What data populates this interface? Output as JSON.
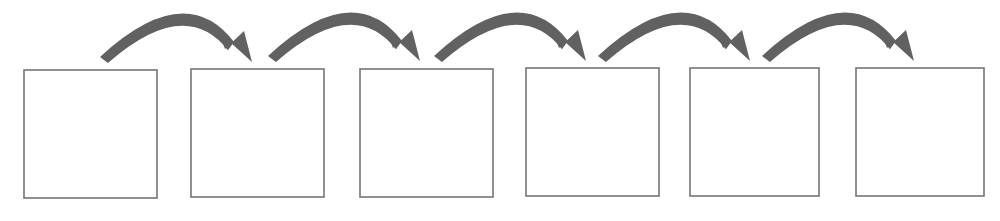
{
  "canvas": {
    "width": 1000,
    "height": 221,
    "background_color": "#ffffff"
  },
  "diagram": {
    "type": "linear-process-flow",
    "title": "",
    "box_count": 6,
    "arrow_count": 5,
    "box_style": {
      "fill": "#ffffff",
      "stroke_color": "#757575",
      "stroke_width": 1.6,
      "width": 133,
      "height": 128
    },
    "arrow_style": {
      "color": "#616161",
      "thickness": 11,
      "shape": "curved-arc-with-triangular-head",
      "direction": "left-to-right"
    },
    "boxes": [
      {
        "index": 1,
        "label": "",
        "x": 24,
        "y": 70,
        "width": 133,
        "height": 128
      },
      {
        "index": 2,
        "label": "",
        "x": 191,
        "y": 69,
        "width": 133,
        "height": 128
      },
      {
        "index": 3,
        "label": "",
        "x": 360,
        "y": 69,
        "width": 133,
        "height": 128
      },
      {
        "index": 4,
        "label": "",
        "x": 526,
        "y": 68,
        "width": 133,
        "height": 128
      },
      {
        "index": 5,
        "label": "",
        "x": 690,
        "y": 68,
        "width": 129,
        "height": 128
      },
      {
        "index": 6,
        "label": "",
        "x": 856,
        "y": 68,
        "width": 128,
        "height": 128
      }
    ],
    "arrows": [
      {
        "index": 1,
        "from_box": 1,
        "to_box": 2,
        "tail_x": 100,
        "tail_y": 57,
        "apex_x": 176,
        "apex_y": 14,
        "tip_x": 252,
        "tip_y": 62
      },
      {
        "index": 2,
        "from_box": 2,
        "to_box": 3,
        "tail_x": 268,
        "tail_y": 56,
        "apex_x": 344,
        "apex_y": 13,
        "tip_x": 420,
        "tip_y": 61
      },
      {
        "index": 3,
        "from_box": 3,
        "to_box": 4,
        "tail_x": 434,
        "tail_y": 56,
        "apex_x": 510,
        "apex_y": 13,
        "tip_x": 586,
        "tip_y": 61
      },
      {
        "index": 4,
        "from_box": 4,
        "to_box": 5,
        "tail_x": 598,
        "tail_y": 56,
        "apex_x": 674,
        "apex_y": 13,
        "tip_x": 750,
        "tip_y": 61
      },
      {
        "index": 5,
        "from_box": 5,
        "to_box": 6,
        "tail_x": 762,
        "tail_y": 56,
        "apex_x": 838,
        "apex_y": 13,
        "tip_x": 914,
        "tip_y": 61
      }
    ]
  }
}
